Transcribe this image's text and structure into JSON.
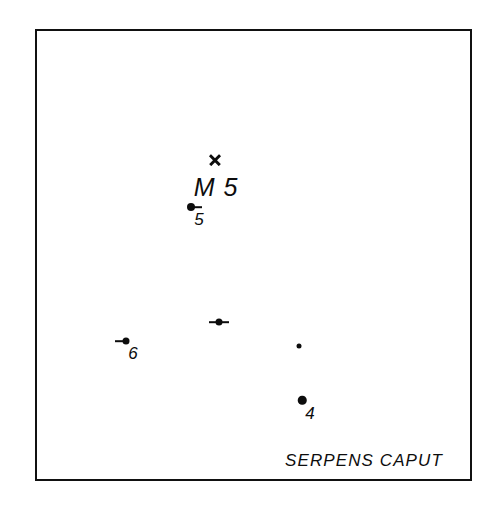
{
  "chart_data": {
    "type": "scatter",
    "title": "M 5",
    "constellation_caption": "SERPENS CAPUT",
    "xlabel": "",
    "ylabel": "",
    "grid": false,
    "legend": null,
    "frame": {
      "x": 35,
      "y": 29,
      "width": 437,
      "height": 452
    },
    "cluster": {
      "name": "M 5",
      "marker": "cross",
      "x": 215,
      "y": 160,
      "label": "M 5",
      "label_x": 216,
      "label_y": 175,
      "label_size": 25
    },
    "stars": [
      {
        "label": "5",
        "x": 191,
        "y": 207,
        "size": 8,
        "tick": "right",
        "tick_length": 11,
        "label_x": 199,
        "label_y": 211,
        "label_size": 17
      },
      {
        "label": "",
        "x": 219,
        "y": 322,
        "size": 7,
        "tick": "both",
        "tick_length": 10,
        "label_x": 219,
        "label_y": 330,
        "label_size": 17
      },
      {
        "label": "6",
        "x": 126,
        "y": 341,
        "size": 7,
        "tick": "left",
        "tick_length": 11,
        "label_x": 133,
        "label_y": 345,
        "label_size": 17
      },
      {
        "label": "",
        "x": 299,
        "y": 346,
        "size": 5,
        "tick": "none",
        "tick_length": 0,
        "label_x": 299,
        "label_y": 354,
        "label_size": 17
      },
      {
        "label": "4",
        "x": 302,
        "y": 400,
        "size": 8.5,
        "tick": "none",
        "tick_length": 0,
        "label_x": 310,
        "label_y": 405,
        "label_size": 17
      }
    ],
    "caption_position": {
      "x": 285,
      "y": 452,
      "size": 17
    }
  },
  "colors": {
    "ink": "#0d0d0d",
    "frame": "#111111",
    "background": "#ffffff"
  }
}
